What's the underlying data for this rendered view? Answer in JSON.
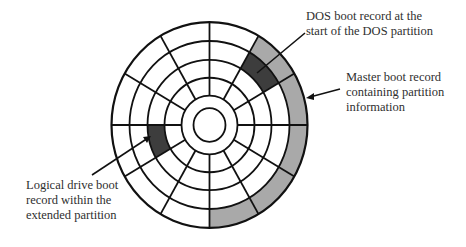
{
  "diagram": {
    "type": "disk-layout",
    "center": {
      "x": 209.5,
      "y": 125
    },
    "rings_radii": [
      98,
      80,
      62,
      45
    ],
    "hub_radius": 28,
    "hole_radius": 16,
    "sector_count": 12,
    "colors": {
      "line": "#111111",
      "light_gray": "#a9a9a9",
      "dark_gray": "#3d3d3d",
      "background": "#ffffff"
    },
    "shaded_cells": [
      {
        "ring": 0,
        "start_deg": 30,
        "end_deg": 60,
        "shade": "light_gray"
      },
      {
        "ring": 1,
        "start_deg": 30,
        "end_deg": 60,
        "shade": "dark_gray"
      },
      {
        "ring": 0,
        "start_deg": -90,
        "end_deg": 30,
        "shade": "light_gray"
      },
      {
        "ring": 2,
        "start_deg": 180,
        "end_deg": 210,
        "shade": "dark_gray"
      }
    ]
  },
  "labels": {
    "dos_boot_record": [
      "DOS boot record at the",
      "start of the DOS partition"
    ],
    "master_boot_record": [
      "Master boot record",
      "containing partition",
      "information"
    ],
    "logical_drive_boot": [
      "Logical drive boot",
      "record within the",
      "extended partition"
    ]
  }
}
